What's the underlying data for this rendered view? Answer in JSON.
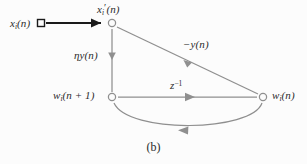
{
  "figure": {
    "caption": "(b)",
    "type": "signal-flow-graph",
    "background_color": "#fcfcfc",
    "line_color": "#8f8f8f",
    "input_line_color": "#1a1a1a",
    "text_color": "#2b2b2b"
  },
  "labels": {
    "source": {
      "base": "x",
      "sub": "i",
      "arg": "(n)"
    },
    "top_node": {
      "base": "x",
      "sub": "i",
      "prime": "′",
      "arg": "(n)"
    },
    "eta_branch": {
      "base": "ηy",
      "arg": "(n)"
    },
    "neg_y_branch": {
      "base": "−y",
      "arg": "(n)"
    },
    "delay_branch": {
      "base": "z",
      "sup": "−1"
    },
    "w_next_node": {
      "base": "w",
      "sub": "i",
      "arg": "(n + 1)"
    },
    "w_node": {
      "base": "w",
      "sub": "i",
      "arg": "(n)"
    }
  },
  "nodes": [
    {
      "name": "input-terminal",
      "shape": "square",
      "x": 41,
      "y": 23
    },
    {
      "name": "x-prime-node",
      "shape": "circle",
      "x": 112,
      "y": 23
    },
    {
      "name": "w-next-node",
      "shape": "circle",
      "x": 112,
      "y": 97
    },
    {
      "name": "w-node",
      "shape": "circle",
      "x": 263,
      "y": 97
    }
  ],
  "edges": [
    {
      "name": "input-edge",
      "from": "input-terminal",
      "to": "x-prime-node",
      "label": "source",
      "style": "thick-black",
      "arrow": "right"
    },
    {
      "name": "eta-edge",
      "from": "x-prime-node",
      "to": "w-next-node",
      "label": "eta_branch",
      "style": "thin-gray",
      "arrow": "down"
    },
    {
      "name": "neg-y-edge",
      "from": "x-prime-node",
      "to": "w-node",
      "label": "neg_y_branch",
      "style": "thin-gray",
      "arrow": "down-right"
    },
    {
      "name": "delay-edge",
      "from": "w-next-node",
      "to": "w-node",
      "label": "delay_branch",
      "style": "thin-gray",
      "arrow": "right"
    },
    {
      "name": "feedback-edge",
      "from": "w-node",
      "to": "w-next-node",
      "label": null,
      "style": "thin-gray-arc",
      "arrow": "left"
    }
  ]
}
